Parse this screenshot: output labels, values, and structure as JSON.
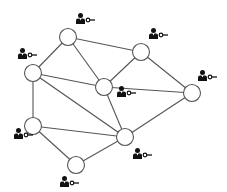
{
  "diagram": {
    "type": "network",
    "colors": {
      "edge": "#555555",
      "node_stroke": "#555555",
      "node_fill": "#ffffff",
      "icon": "#111111"
    },
    "node_radius": 8.5,
    "nodes": [
      {
        "id": "n1",
        "x": 68,
        "y": 37,
        "icon": {
          "x": 76,
          "y": 13,
          "name": "user-key-icon"
        }
      },
      {
        "id": "n2",
        "x": 33,
        "y": 73,
        "icon": {
          "x": 18,
          "y": 48,
          "name": "user-key-icon"
        }
      },
      {
        "id": "n3",
        "x": 141,
        "y": 52,
        "icon": {
          "x": 149,
          "y": 28,
          "name": "user-key-icon"
        }
      },
      {
        "id": "n4",
        "x": 104,
        "y": 87,
        "icon": {
          "x": 117,
          "y": 86,
          "name": "user-key-icon"
        }
      },
      {
        "id": "n5",
        "x": 192,
        "y": 93,
        "icon": {
          "x": 198,
          "y": 70,
          "name": "user-key-icon"
        }
      },
      {
        "id": "n6",
        "x": 33,
        "y": 126,
        "icon": {
          "x": 14,
          "y": 128,
          "name": "user-key-icon"
        }
      },
      {
        "id": "n7",
        "x": 125,
        "y": 137,
        "icon": {
          "x": 133,
          "y": 148,
          "name": "user-key-icon"
        }
      },
      {
        "id": "n8",
        "x": 76,
        "y": 165,
        "icon": {
          "x": 60,
          "y": 176,
          "name": "user-key-icon"
        }
      }
    ],
    "edges": [
      [
        "n1",
        "n2"
      ],
      [
        "n1",
        "n3"
      ],
      [
        "n1",
        "n4"
      ],
      [
        "n2",
        "n4"
      ],
      [
        "n2",
        "n6"
      ],
      [
        "n2",
        "n7"
      ],
      [
        "n3",
        "n4"
      ],
      [
        "n3",
        "n5"
      ],
      [
        "n4",
        "n5"
      ],
      [
        "n4",
        "n7"
      ],
      [
        "n5",
        "n7"
      ],
      [
        "n6",
        "n7"
      ],
      [
        "n6",
        "n8"
      ],
      [
        "n7",
        "n8"
      ]
    ]
  }
}
